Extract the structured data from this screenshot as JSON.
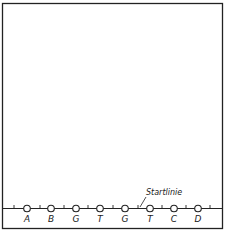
{
  "diagram": {
    "start_line_label": "Startlinie",
    "lanes": [
      {
        "label": "A",
        "x": 27
      },
      {
        "label": "B",
        "x": 51
      },
      {
        "label": "G",
        "x": 76
      },
      {
        "label": "T",
        "x": 100
      },
      {
        "label": "G",
        "x": 125
      },
      {
        "label": "T",
        "x": 150
      },
      {
        "label": "C",
        "x": 174
      },
      {
        "label": "D",
        "x": 198
      }
    ],
    "ticks": [
      14,
      40,
      64,
      88,
      113,
      138,
      162,
      186,
      210
    ],
    "colors": {
      "line": "#222222",
      "background": "#ffffff"
    }
  }
}
